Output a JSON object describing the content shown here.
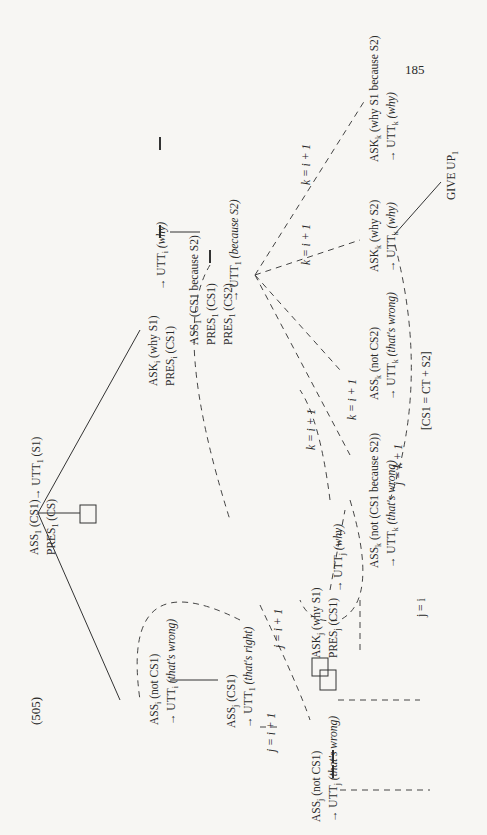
{
  "page_number": "185",
  "example_number": "(505)",
  "nodes": {
    "root_line1": "ASS",
    "root_line1_sub": "1",
    "root_line1_arg": "(CS1)",
    "root_line2": "PRES",
    "root_line2_sub": "1",
    "root_line2_arg": "(CS)",
    "root_utt": "→ UTT",
    "root_utt_sub": "1",
    "root_utt_arg": "(S1)",
    "ask_i_line1": "ASK",
    "ask_i_sub": "i",
    "ask_i_arg": "(why S1)",
    "ask_i_line2": "PRES",
    "ask_i_line2_sub": "i",
    "ask_i_line2_arg": "(CS1)",
    "ask_i_utt": "→ UTT",
    "ask_i_utt_sub": "i",
    "ask_i_utt_arg": "(why)",
    "ass1b_line1": "ASS",
    "ass1b_sub": "1",
    "ass1b_arg": "(CS1 because S2)",
    "ass1b_line2": "PRES",
    "ass1b_line2_sub": "1",
    "ass1b_line2_arg": "(CS1)",
    "ass1b_line3": "PRES",
    "ass1b_line3_sub": "1",
    "ass1b_line3_arg": "(CS2)",
    "ass1b_utt": "→ UTT",
    "ass1b_utt_sub": "1",
    "ass1b_utt_arg": "(because S2)",
    "askk_s1_line1": "ASK",
    "askk_s1_sub": "k",
    "askk_s1_arg": "(why S1 because S2)",
    "askk_s1_utt": "→ UTT",
    "askk_s1_utt_sub": "k",
    "askk_s1_utt_arg": "(why)",
    "askk_s2_line1": "ASK",
    "askk_s2_sub": "k",
    "askk_s2_arg": "(why S2)",
    "askk_s2_utt": "→ UTT",
    "askk_s2_utt_sub": "k",
    "askk_s2_utt_arg": "(why)",
    "give_up": "GIVE UP",
    "give_up_sub": "1",
    "assk_cs2_line1": "ASS",
    "assk_cs2_sub": "k",
    "assk_cs2_arg": "(not CS2)",
    "assk_cs2_utt": "→ UTT",
    "assk_cs2_utt_sub": "k",
    "assk_cs2_utt_arg": "(that's wrong)",
    "assk_b_line1": "ASS",
    "assk_b_sub": "k",
    "assk_b_arg": "(not (CS1 because S2))",
    "assk_b_utt": "→ UTT",
    "assk_b_utt_sub": "k",
    "assk_b_utt_arg": "(that's wrong)",
    "ass_i_not_line1": "ASS",
    "ass_i_not_sub": "i",
    "ass_i_not_arg": "(not CS1)",
    "ass_i_not_utt": "→ UTT",
    "ass_i_not_utt_sub": "i",
    "ass_i_not_utt_arg": "(that's wrong)",
    "ass_j_cs1_line1": "ASS",
    "ass_j_cs1_sub": "j",
    "ass_j_cs1_arg": "(CS1)",
    "ass_j_cs1_utt": "→ UTT",
    "ass_j_cs1_utt_sub": "1",
    "ass_j_cs1_utt_arg": "(that's right)",
    "askj_line1": "ASK",
    "askj_sub": "j",
    "askj_arg": "(why S1)",
    "askj_line2": "PRES",
    "askj_line2_sub": "j",
    "askj_line2_arg": "(CS1)",
    "askj_utt": "→ UTT",
    "askj_utt_sub": "j",
    "askj_utt_arg": "(why)",
    "ass_j_not_line1": "ASS",
    "ass_j_not_sub": "j",
    "ass_j_not_arg": "(not CS1)",
    "ass_j_not_utt": "→ UTT",
    "ass_j_not_utt_sub": "j",
    "ass_j_not_utt_arg": "(that's wrong)"
  },
  "edge_labels": {
    "k_i1_top": "k = i + 1",
    "k_i1_mid": "k = i + 1",
    "k_i1_a": "k = i + 1",
    "k_i1_b": "k = i + 1",
    "j_k1": "j = k + 1",
    "cs1_eq": "[CS1 = CT + S2]",
    "j_eq_i": "j = i",
    "j_i1_up": "j = i + 1",
    "j_i1_down": "j = i + 1"
  }
}
